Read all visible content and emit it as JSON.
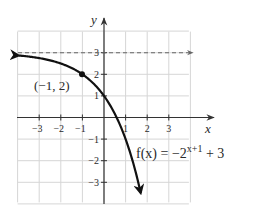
{
  "chart_data": {
    "type": "line",
    "title": "",
    "xlabel": "x",
    "ylabel": "y",
    "xlim": [
      -4,
      4
    ],
    "ylim": [
      -4,
      4
    ],
    "grid": true,
    "x_ticks": [
      -3,
      -2,
      -1,
      1,
      2,
      3
    ],
    "y_ticks": [
      3,
      2,
      1,
      -1,
      -2,
      -3
    ],
    "x_tick_labels": [
      "−3",
      "−2",
      "−1",
      "1",
      "2",
      "3"
    ],
    "y_tick_labels": [
      "3",
      "2",
      "1",
      "−1",
      "−2",
      "−3"
    ],
    "series": [
      {
        "name": "f(x) = −2^(x+1) + 3",
        "expression": "-2^(x+1) + 3",
        "x": [
          -4,
          -3,
          -2,
          -1,
          0,
          0.585,
          1,
          1.5,
          1.72
        ],
        "y": [
          2.875,
          2.75,
          2.5,
          2,
          1,
          0,
          -1,
          -2.66,
          -3.6
        ],
        "style": "solid",
        "color": "#111111"
      },
      {
        "name": "horizontal asymptote y = 3",
        "x": [
          -4,
          4
        ],
        "y": [
          3,
          3
        ],
        "style": "dashed",
        "color": "#555555"
      }
    ],
    "annotations": [
      {
        "text": "(−1, 2)",
        "point": [
          -1,
          2
        ],
        "marker": "dot"
      },
      {
        "text_prefix": "f(x) = −2",
        "text_sup": "x+1",
        "text_suffix": " + 3"
      }
    ],
    "legend": null
  },
  "labels": {
    "x_axis": "x",
    "y_axis": "y",
    "point": "(−1, 2)",
    "func_prefix": "f(x) = −2",
    "func_sup": "x+1",
    "func_suffix": " + 3",
    "x_ticks": [
      "−3",
      "−2",
      "−1",
      "1",
      "2",
      "3"
    ],
    "y_ticks": [
      "3",
      "2",
      "1",
      "−1",
      "−2",
      "−3"
    ]
  },
  "colors": {
    "grid": "#d4d4d4",
    "axis": "#333333",
    "curve": "#111111",
    "asymptote": "#666666"
  }
}
